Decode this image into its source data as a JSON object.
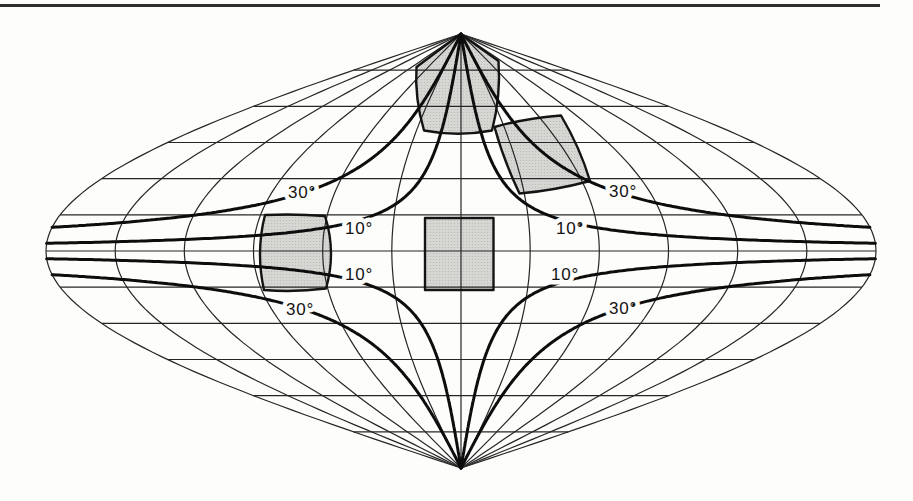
{
  "figure": {
    "projection": "sinusoidal",
    "colors": {
      "background": "#fdfdfb",
      "graticule_line": "#262626",
      "isoline": "#0d0d0d",
      "sample_fill": "#d6d6d2",
      "sample_dot": "#b9b9b4",
      "sample_edge": "#141414",
      "label": "#141414",
      "top_rule": "#2e2e2e"
    },
    "top_rule": {
      "x": 0,
      "y": 4,
      "width": 880,
      "height": 3
    },
    "layout": {
      "canvas_w": 913,
      "canvas_h": 501,
      "cx": 461,
      "cy": 251,
      "half_width": 415,
      "half_height": 217
    },
    "graticule": {
      "parallel_interval_deg": 15,
      "meridian_interval_deg": 30,
      "lat_max": 90,
      "lon_max": 180
    },
    "isolines": [
      {
        "label": "10°",
        "value_deg": 10,
        "const_deg": 10.03
      },
      {
        "label": "30°",
        "value_deg": 30,
        "const_deg": 30.7
      }
    ],
    "isoline_labels": [
      {
        "text": "30°",
        "x": 302,
        "y": 192
      },
      {
        "text": "10°",
        "x": 359,
        "y": 228.5
      },
      {
        "text": "10°",
        "x": 359,
        "y": 274
      },
      {
        "text": "30°",
        "x": 300,
        "y": 309
      },
      {
        "text": "30°",
        "x": 623,
        "y": 191.5
      },
      {
        "text": "10°",
        "x": 570,
        "y": 228
      },
      {
        "text": "10°",
        "x": 565,
        "y": 274.5
      },
      {
        "text": "30°",
        "x": 623,
        "y": 308
      }
    ],
    "distortion_samples": [
      {
        "name": "polar-sample",
        "d": "M 460.5 34 L 498.5 61 Q 501 96 492 130.5 Q 458 137 424 130.5 Q 414.5 98 416.5 67 Z"
      },
      {
        "name": "midlatitude-northeast-sample",
        "d": "M 494.5 127 Q 527 118 561 115.5 Q 580 147.5 590 181 Q 554.5 190.5 519.5 193.5 Q 503.5 160 494.5 127 Z"
      },
      {
        "name": "equator-west-sample",
        "d": "M 265 215 Q 255.5 252 264 290 Q 295 292.5 326 288.5 Q 336.5 252 325 216 Q 295 213.5 265 215 Z"
      },
      {
        "name": "equator-central-sample",
        "d": "M 425 218 L 493.5 218 L 493.5 290 L 425 290 Z"
      }
    ]
  }
}
